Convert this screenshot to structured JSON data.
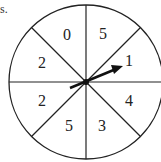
{
  "cropped_text": "s.",
  "spinner": {
    "sections": [
      {
        "position": "top-left",
        "value": "0"
      },
      {
        "position": "top-right",
        "value": "5"
      },
      {
        "position": "right-upper",
        "value": "1"
      },
      {
        "position": "right-lower",
        "value": "4"
      },
      {
        "position": "bottom-right",
        "value": "3"
      },
      {
        "position": "bottom-left",
        "value": "5"
      },
      {
        "position": "left-lower",
        "value": "2"
      },
      {
        "position": "left-upper",
        "value": "2"
      }
    ],
    "arrow_points_to": "1"
  }
}
